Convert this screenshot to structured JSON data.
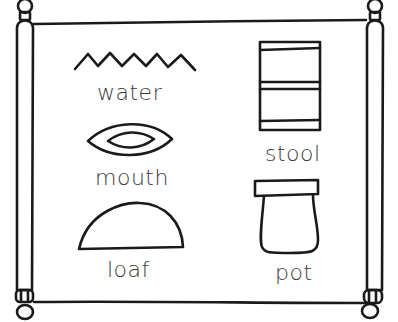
{
  "scroll": {
    "description": "Hieroglyph chart on a scroll",
    "glyphs": [
      {
        "id": "water",
        "label": "water",
        "icon": "zigzag-water-icon"
      },
      {
        "id": "mouth",
        "label": "mouth",
        "icon": "eye-shaped-mouth-icon"
      },
      {
        "id": "loaf",
        "label": "loaf",
        "icon": "half-dome-loaf-icon"
      },
      {
        "id": "stool",
        "label": "stool",
        "icon": "rectangular-stool-icon"
      },
      {
        "id": "pot",
        "label": "pot",
        "icon": "lidded-pot-icon"
      }
    ]
  },
  "colors": {
    "ink": "#1a1a1a",
    "text": "#3a3a3a",
    "paper": "#ffffff"
  }
}
